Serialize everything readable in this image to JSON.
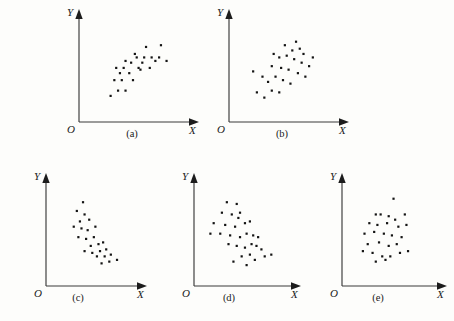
{
  "figure": {
    "background_color": "#fdfdfb",
    "ink_color": "#141414",
    "panel_count": 5
  },
  "chart_data": [
    {
      "type": "scatter",
      "title": "(a)",
      "caption": "(a)",
      "xlabel": "X",
      "ylabel": "Y",
      "origin_label": "O",
      "relationship": "positive linear correlation",
      "xlim": [
        0,
        100
      ],
      "ylim": [
        0,
        100
      ],
      "grid": false,
      "legend": "none",
      "points": [
        [
          22,
          18
        ],
        [
          30,
          24
        ],
        [
          38,
          24
        ],
        [
          26,
          36
        ],
        [
          34,
          36
        ],
        [
          46,
          36
        ],
        [
          28,
          50
        ],
        [
          36,
          50
        ],
        [
          44,
          56
        ],
        [
          52,
          50
        ],
        [
          50,
          62
        ],
        [
          58,
          62
        ],
        [
          66,
          62
        ],
        [
          74,
          62
        ],
        [
          82,
          58
        ],
        [
          60,
          74
        ],
        [
          76,
          76
        ],
        [
          54,
          48
        ],
        [
          42,
          44
        ],
        [
          64,
          50
        ],
        [
          70,
          58
        ],
        [
          48,
          66
        ],
        [
          56,
          56
        ],
        [
          38,
          58
        ],
        [
          32,
          44
        ]
      ]
    },
    {
      "type": "scatter",
      "title": "(b)",
      "caption": "(b)",
      "xlabel": "X",
      "ylabel": "Y",
      "origin_label": "O",
      "relationship": "weak or no correlation, diffuse cloud",
      "xlim": [
        0,
        100
      ],
      "ylim": [
        0,
        100
      ],
      "grid": false,
      "legend": "none",
      "points": [
        [
          18,
          22
        ],
        [
          26,
          16
        ],
        [
          34,
          24
        ],
        [
          30,
          34
        ],
        [
          42,
          22
        ],
        [
          14,
          46
        ],
        [
          24,
          40
        ],
        [
          38,
          40
        ],
        [
          46,
          36
        ],
        [
          54,
          32
        ],
        [
          34,
          52
        ],
        [
          44,
          50
        ],
        [
          52,
          48
        ],
        [
          62,
          44
        ],
        [
          70,
          40
        ],
        [
          42,
          62
        ],
        [
          50,
          64
        ],
        [
          58,
          60
        ],
        [
          66,
          56
        ],
        [
          74,
          52
        ],
        [
          48,
          76
        ],
        [
          60,
          80
        ],
        [
          68,
          66
        ],
        [
          78,
          62
        ],
        [
          56,
          70
        ],
        [
          36,
          66
        ],
        [
          64,
          72
        ]
      ]
    },
    {
      "type": "scatter",
      "title": "(c)",
      "caption": "(c)",
      "xlabel": "X",
      "ylabel": "Y",
      "origin_label": "O",
      "relationship": "negative linear correlation",
      "xlim": [
        0,
        100
      ],
      "ylim": [
        0,
        100
      ],
      "grid": false,
      "legend": "none",
      "points": [
        [
          36,
          84
        ],
        [
          28,
          74
        ],
        [
          38,
          70
        ],
        [
          32,
          62
        ],
        [
          44,
          64
        ],
        [
          24,
          56
        ],
        [
          34,
          54
        ],
        [
          42,
          52
        ],
        [
          30,
          44
        ],
        [
          40,
          42
        ],
        [
          52,
          56
        ],
        [
          50,
          44
        ],
        [
          46,
          34
        ],
        [
          56,
          36
        ],
        [
          62,
          38
        ],
        [
          38,
          28
        ],
        [
          48,
          26
        ],
        [
          58,
          28
        ],
        [
          66,
          30
        ],
        [
          54,
          22
        ],
        [
          64,
          22
        ],
        [
          72,
          24
        ],
        [
          70,
          16
        ],
        [
          60,
          14
        ],
        [
          80,
          18
        ]
      ]
    },
    {
      "type": "scatter",
      "title": "(d)",
      "caption": "(d)",
      "xlabel": "X",
      "ylabel": "Y",
      "origin_label": "O",
      "relationship": "negative correlation with wider scatter",
      "xlim": [
        0,
        100
      ],
      "ylim": [
        0,
        100
      ],
      "grid": false,
      "legend": "none",
      "points": [
        [
          28,
          84
        ],
        [
          40,
          82
        ],
        [
          22,
          72
        ],
        [
          34,
          70
        ],
        [
          44,
          72
        ],
        [
          42,
          66
        ],
        [
          12,
          60
        ],
        [
          26,
          58
        ],
        [
          38,
          56
        ],
        [
          50,
          60
        ],
        [
          56,
          62
        ],
        [
          8,
          48
        ],
        [
          20,
          48
        ],
        [
          32,
          46
        ],
        [
          44,
          44
        ],
        [
          52,
          48
        ],
        [
          60,
          46
        ],
        [
          66,
          44
        ],
        [
          30,
          36
        ],
        [
          40,
          34
        ],
        [
          50,
          32
        ],
        [
          58,
          36
        ],
        [
          64,
          34
        ],
        [
          70,
          30
        ],
        [
          46,
          22
        ],
        [
          56,
          24
        ],
        [
          62,
          18
        ],
        [
          74,
          22
        ],
        [
          82,
          24
        ],
        [
          52,
          12
        ],
        [
          36,
          16
        ]
      ]
    },
    {
      "type": "scatter",
      "title": "(e)",
      "caption": "(e)",
      "xlabel": "X",
      "ylabel": "Y",
      "origin_label": "O",
      "relationship": "no correlation, random cluster",
      "xlim": [
        0,
        100
      ],
      "ylim": [
        0,
        100
      ],
      "grid": false,
      "legend": "none",
      "points": [
        [
          52,
          88
        ],
        [
          30,
          70
        ],
        [
          36,
          70
        ],
        [
          46,
          68
        ],
        [
          54,
          64
        ],
        [
          66,
          70
        ],
        [
          22,
          60
        ],
        [
          32,
          58
        ],
        [
          44,
          60
        ],
        [
          58,
          56
        ],
        [
          68,
          58
        ],
        [
          16,
          48
        ],
        [
          28,
          50
        ],
        [
          40,
          48
        ],
        [
          50,
          46
        ],
        [
          62,
          44
        ],
        [
          20,
          36
        ],
        [
          34,
          38
        ],
        [
          46,
          34
        ],
        [
          56,
          36
        ],
        [
          14,
          28
        ],
        [
          26,
          26
        ],
        [
          38,
          22
        ],
        [
          48,
          22
        ],
        [
          60,
          26
        ],
        [
          70,
          28
        ],
        [
          42,
          18
        ],
        [
          30,
          16
        ]
      ]
    }
  ]
}
